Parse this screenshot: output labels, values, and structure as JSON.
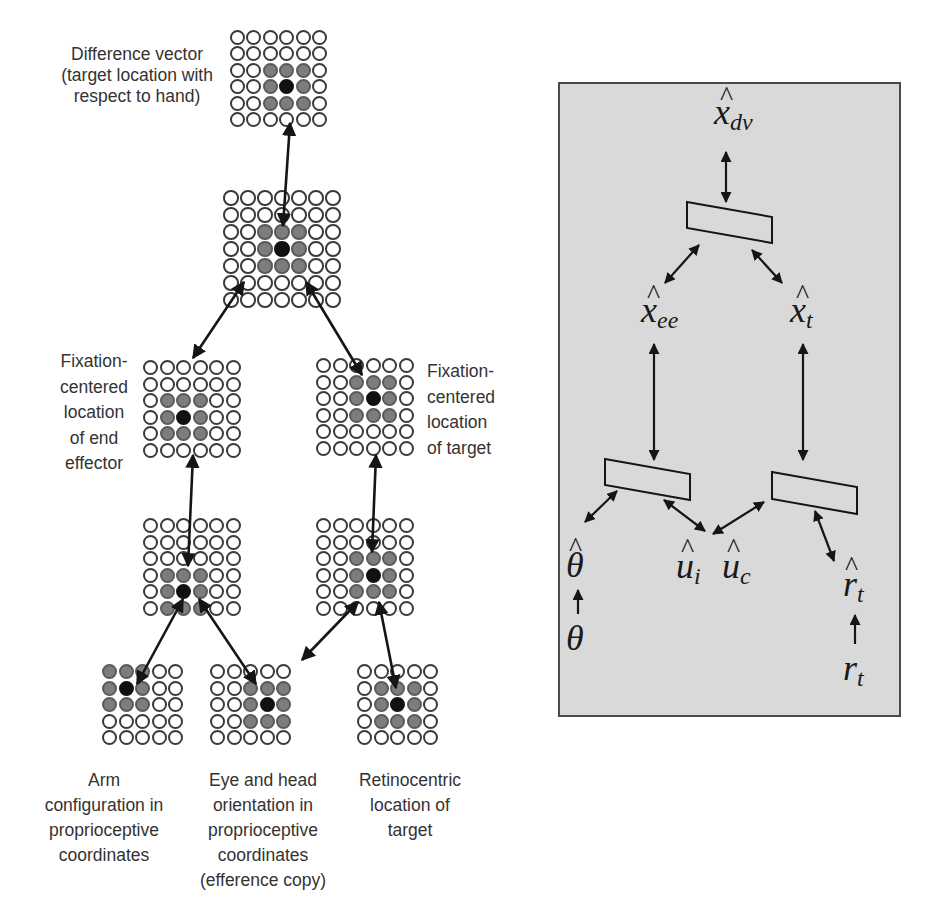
{
  "left_diagram": {
    "grids": [
      {
        "id": "difference-vector",
        "x": 230,
        "y": 30,
        "cols": 6,
        "rows": 6,
        "pitch": 16.4,
        "size": 15,
        "grey": [
          [
            2,
            2
          ],
          [
            2,
            3
          ],
          [
            2,
            4
          ],
          [
            3,
            2
          ],
          [
            3,
            4
          ],
          [
            4,
            2
          ],
          [
            4,
            3
          ],
          [
            4,
            4
          ]
        ],
        "black": [
          3,
          3
        ]
      },
      {
        "id": "combined-layer",
        "x": 223,
        "y": 190,
        "cols": 7,
        "rows": 7,
        "pitch": 17,
        "size": 15.5,
        "grey": [
          [
            2,
            2
          ],
          [
            2,
            3
          ],
          [
            2,
            4
          ],
          [
            3,
            2
          ],
          [
            3,
            4
          ],
          [
            4,
            2
          ],
          [
            4,
            3
          ],
          [
            4,
            4
          ]
        ],
        "black": [
          3,
          3
        ]
      },
      {
        "id": "fixation-end-effector",
        "x": 143,
        "y": 360,
        "cols": 6,
        "rows": 6,
        "pitch": 16.6,
        "size": 15,
        "grey": [
          [
            2,
            1
          ],
          [
            2,
            2
          ],
          [
            2,
            3
          ],
          [
            3,
            1
          ],
          [
            3,
            3
          ],
          [
            4,
            1
          ],
          [
            4,
            2
          ],
          [
            4,
            3
          ]
        ],
        "black": [
          3,
          2
        ]
      },
      {
        "id": "fixation-target",
        "x": 316,
        "y": 358,
        "cols": 6,
        "rows": 6,
        "pitch": 16.6,
        "size": 15,
        "grey": [
          [
            1,
            2
          ],
          [
            1,
            3
          ],
          [
            1,
            4
          ],
          [
            2,
            2
          ],
          [
            2,
            4
          ],
          [
            3,
            2
          ],
          [
            3,
            3
          ],
          [
            3,
            4
          ]
        ],
        "black": [
          2,
          3
        ]
      },
      {
        "id": "intermediate-left",
        "x": 143,
        "y": 518,
        "cols": 6,
        "rows": 6,
        "pitch": 16.6,
        "size": 15,
        "grey": [
          [
            3,
            1
          ],
          [
            3,
            2
          ],
          [
            3,
            3
          ],
          [
            4,
            1
          ],
          [
            4,
            3
          ],
          [
            5,
            1
          ],
          [
            5,
            2
          ],
          [
            5,
            3
          ]
        ],
        "black": [
          4,
          2
        ]
      },
      {
        "id": "intermediate-right",
        "x": 316,
        "y": 518,
        "cols": 6,
        "rows": 6,
        "pitch": 16.6,
        "size": 15,
        "grey": [
          [
            2,
            2
          ],
          [
            2,
            3
          ],
          [
            2,
            4
          ],
          [
            3,
            2
          ],
          [
            3,
            4
          ],
          [
            4,
            2
          ],
          [
            4,
            3
          ],
          [
            4,
            4
          ]
        ],
        "black": [
          3,
          3
        ]
      },
      {
        "id": "arm-configuration",
        "x": 102,
        "y": 664,
        "cols": 5,
        "rows": 5,
        "pitch": 16.6,
        "size": 15,
        "grey": [
          [
            0,
            0
          ],
          [
            0,
            1
          ],
          [
            0,
            2
          ],
          [
            1,
            0
          ],
          [
            1,
            2
          ],
          [
            2,
            0
          ],
          [
            2,
            1
          ],
          [
            2,
            2
          ]
        ],
        "black": [
          1,
          1
        ]
      },
      {
        "id": "eye-head-orientation",
        "x": 210,
        "y": 664,
        "cols": 5,
        "rows": 5,
        "pitch": 16.6,
        "size": 15,
        "grey": [
          [
            1,
            2
          ],
          [
            1,
            3
          ],
          [
            1,
            4
          ],
          [
            2,
            2
          ],
          [
            2,
            4
          ],
          [
            3,
            2
          ],
          [
            3,
            3
          ],
          [
            3,
            4
          ]
        ],
        "black": [
          2,
          3
        ]
      },
      {
        "id": "retinocentric-target",
        "x": 357,
        "y": 664,
        "cols": 5,
        "rows": 5,
        "pitch": 16.6,
        "size": 15,
        "grey": [
          [
            1,
            1
          ],
          [
            1,
            2
          ],
          [
            1,
            3
          ],
          [
            2,
            1
          ],
          [
            2,
            3
          ],
          [
            3,
            1
          ],
          [
            3,
            2
          ],
          [
            3,
            3
          ]
        ],
        "black": [
          2,
          2
        ]
      }
    ],
    "labels": {
      "difference_vector": [
        "Difference vector",
        "(target location with",
        "respect to hand)"
      ],
      "fixation_end_effector": [
        "Fixation-",
        "centered",
        "location",
        "of end",
        "effector"
      ],
      "fixation_target": [
        "Fixation-",
        "centered",
        "location",
        "of target"
      ],
      "arm": [
        "Arm",
        "configuration in",
        "proprioceptive",
        "coordinates"
      ],
      "eye_head": [
        "Eye and head",
        "orientation in",
        "proprioceptive",
        "coordinates",
        "(efference copy)"
      ],
      "retinocentric": [
        "Retinocentric",
        "location of",
        "target"
      ]
    }
  },
  "right_diagram": {
    "background": "#d9d9d9",
    "variables": {
      "x_dv": {
        "base": "x",
        "sub": "dv",
        "hat": "^"
      },
      "x_ee": {
        "base": "x",
        "sub": "ee",
        "hat": "^"
      },
      "x_t": {
        "base": "x",
        "sub": "t",
        "hat": "^"
      },
      "theta_hat": {
        "base": "θ",
        "hat": "^"
      },
      "theta": {
        "base": "θ"
      },
      "u_i": {
        "base": "u",
        "sub": "i",
        "hat": "^"
      },
      "u_c": {
        "base": "u",
        "sub": "c",
        "hat": "^"
      },
      "r_t_hat": {
        "base": "r",
        "sub": "t",
        "hat": "^"
      },
      "r_t": {
        "base": "r",
        "sub": "t"
      }
    }
  }
}
